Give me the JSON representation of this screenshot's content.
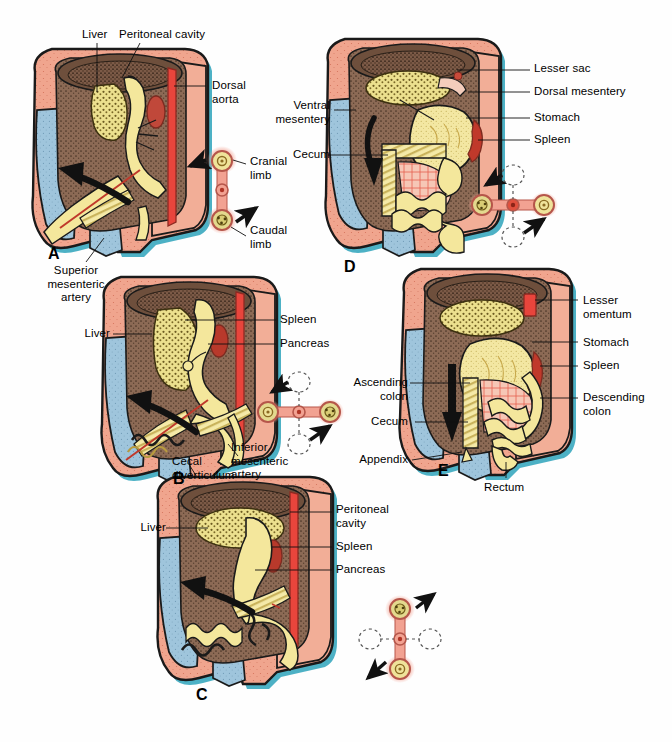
{
  "figure": {
    "background_color": "#ffffff",
    "panels": [
      "A",
      "B",
      "C",
      "D",
      "E"
    ]
  },
  "colors": {
    "body_wall_pink": "#f0a58e",
    "body_wall_pink_light": "#f4b7a2",
    "peritoneal_cavity_brown": "#8c6a55",
    "cavity_brown_dark": "#6f523f",
    "gut_yellow": "#f5e9a0",
    "gut_yellow_deep": "#efdf8a",
    "liver_yellow": "#e8dd8c",
    "artery_red": "#e8453c",
    "spleen_red": "#c0392b",
    "vessel_pink": "#f07a6a",
    "limb_blue": "#9fc5dc",
    "outline_teal": "#3aa9bf",
    "outline_black": "#1a1a1a",
    "text_black": "#000000"
  },
  "panel_a": {
    "letter": "A",
    "labels": [
      {
        "id": "liver",
        "text": "Liver"
      },
      {
        "id": "peritoneal-cavity",
        "text": "Peritoneal cavity"
      },
      {
        "id": "dorsal-aorta",
        "text": "Dorsal\naorta"
      },
      {
        "id": "superior-mesenteric-artery",
        "text": "Superior\nmesenteric\nartery"
      }
    ],
    "inset": {
      "id": "rotation-inset-a",
      "orientation": "vertical",
      "rotation_degrees": 0,
      "labels": [
        {
          "id": "cranial-limb",
          "text": "Cranial\nlimb"
        },
        {
          "id": "caudal-limb",
          "text": "Caudal\nlimb"
        }
      ],
      "arrows": [
        {
          "id": "arrow-cranial",
          "direction": "left"
        },
        {
          "id": "arrow-caudal",
          "direction": "upper-right"
        }
      ]
    }
  },
  "panel_b": {
    "letter": "B",
    "labels": [
      {
        "id": "liver",
        "text": "Liver"
      },
      {
        "id": "spleen",
        "text": "Spleen"
      },
      {
        "id": "pancreas",
        "text": "Pancreas"
      },
      {
        "id": "cecal-diverticulum",
        "text": "Cecal\ndiverticulum"
      },
      {
        "id": "inferior-mesenteric-artery",
        "text": "Inferior\nmesenteric\nartery"
      }
    ],
    "inset": {
      "id": "rotation-inset-b",
      "orientation": "horizontal",
      "rotation_degrees": 90,
      "labels": [],
      "arrows": [
        {
          "id": "arrow-upper-left",
          "direction": "upper-left"
        },
        {
          "id": "arrow-lower-right",
          "direction": "upper-right"
        }
      ]
    }
  },
  "panel_c": {
    "letter": "C",
    "labels": [
      {
        "id": "liver",
        "text": "Liver"
      },
      {
        "id": "peritoneal-cavity",
        "text": "Peritoneal\ncavity"
      },
      {
        "id": "spleen",
        "text": "Spleen"
      },
      {
        "id": "pancreas",
        "text": "Pancreas"
      }
    ],
    "inset": {
      "id": "rotation-inset-c",
      "orientation": "vertical-flipped",
      "rotation_degrees": 180,
      "labels": [],
      "arrows": [
        {
          "id": "arrow-upper-right",
          "direction": "upper-right"
        },
        {
          "id": "arrow-lower-left",
          "direction": "lower-left"
        }
      ]
    }
  },
  "panel_d": {
    "letter": "D",
    "labels": [
      {
        "id": "lesser-sac",
        "text": "Lesser sac"
      },
      {
        "id": "dorsal-mesentery",
        "text": "Dorsal mesentery"
      },
      {
        "id": "stomach",
        "text": "Stomach"
      },
      {
        "id": "spleen",
        "text": "Spleen"
      },
      {
        "id": "ventral-mesentery",
        "text": "Ventral\nmesentery"
      },
      {
        "id": "cecum",
        "text": "Cecum"
      }
    ],
    "inset": {
      "id": "rotation-inset-d",
      "orientation": "horizontal-flipped",
      "rotation_degrees": 270,
      "labels": [],
      "arrows": [
        {
          "id": "arrow-upper-left",
          "direction": "upper-left"
        },
        {
          "id": "arrow-lower-right",
          "direction": "upper-right"
        }
      ]
    }
  },
  "panel_e": {
    "letter": "E",
    "labels": [
      {
        "id": "lesser-omentum",
        "text": "Lesser\nomentum"
      },
      {
        "id": "stomach",
        "text": "Stomach"
      },
      {
        "id": "spleen",
        "text": "Spleen"
      },
      {
        "id": "descending-colon",
        "text": "Descending\ncolon"
      },
      {
        "id": "ascending-colon",
        "text": "Ascending\ncolon"
      },
      {
        "id": "cecum",
        "text": "Cecum"
      },
      {
        "id": "appendix",
        "text": "Appendix"
      },
      {
        "id": "rectum",
        "text": "Rectum"
      }
    ],
    "inset": null
  }
}
